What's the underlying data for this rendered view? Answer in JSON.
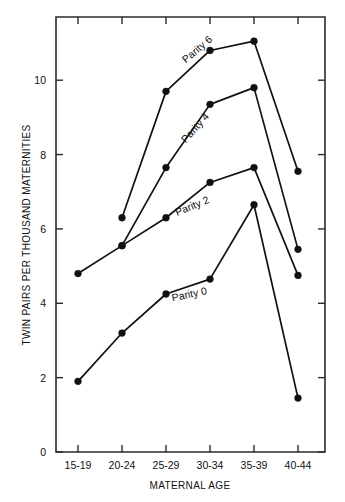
{
  "chart_data": {
    "type": "line",
    "title": "",
    "xlabel": "MATERNAL AGE",
    "ylabel": "TWIN PAIRS PER THOUSAND MATERNITIES",
    "categories": [
      "15-19",
      "20-24",
      "25-29",
      "30-34",
      "35-39",
      "40-44"
    ],
    "xticklabels": [
      "15-19",
      "20-24",
      "25-29",
      "30-34",
      "35-39",
      "40-44"
    ],
    "yticklabels": [
      "0",
      "2",
      "4",
      "6",
      "8",
      "10"
    ],
    "ytickvalues": [
      0,
      2,
      4,
      6,
      8,
      10
    ],
    "ylim": [
      0,
      11.7
    ],
    "grid": false,
    "legend_position": "inline-annotations",
    "marker": "filled-circle",
    "series": [
      {
        "name": "Parity 0",
        "label": "Parity 0",
        "values": [
          1.9,
          3.2,
          4.25,
          4.65,
          6.65,
          1.45
        ]
      },
      {
        "name": "Parity 2",
        "label": "Parity 2",
        "values": [
          4.8,
          5.55,
          6.3,
          7.25,
          7.65,
          4.75
        ]
      },
      {
        "name": "Parity 4",
        "label": "Parity 4",
        "values": [
          null,
          5.55,
          7.65,
          9.35,
          9.8,
          5.45
        ]
      },
      {
        "name": "Parity 6",
        "label": "Parity 6",
        "values": [
          null,
          6.3,
          9.7,
          10.8,
          11.05,
          7.55
        ]
      }
    ],
    "annotations": [
      {
        "text": "Parity 6",
        "x": 2.45,
        "y": 10.45,
        "rotation": -40
      },
      {
        "text": "Parity 4",
        "x": 2.45,
        "y": 8.3,
        "rotation": -48
      },
      {
        "text": "Parity 2",
        "x": 2.25,
        "y": 6.35,
        "rotation": -22
      },
      {
        "text": "Parity 0",
        "x": 2.15,
        "y": 4.05,
        "rotation": -12
      }
    ],
    "colors": {
      "line": "#111111",
      "marker": "#111111",
      "axis": "#2b2b2b",
      "background": "#ffffff"
    }
  }
}
